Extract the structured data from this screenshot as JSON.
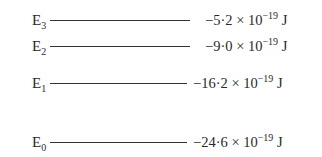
{
  "levels": [
    {
      "id": "E3",
      "letter": "E",
      "sub": "3",
      "mantissa": "−5·2 × 10",
      "exp": "−19",
      "unit": " J",
      "y": 20,
      "line_end": 190,
      "val_x": 205
    },
    {
      "id": "E2",
      "letter": "E",
      "sub": "2",
      "mantissa": "−9·0 × 10",
      "exp": "−19",
      "unit": " J",
      "y": 46,
      "line_end": 190,
      "val_x": 205
    },
    {
      "id": "E1",
      "letter": "E",
      "sub": "1",
      "mantissa": "−16·2 × 10",
      "exp": "−19",
      "unit": " J",
      "y": 83,
      "line_end": 187,
      "val_x": 193
    },
    {
      "id": "E0",
      "letter": "E",
      "sub": "0",
      "mantissa": "−24·6 × 10",
      "exp": "−19",
      "unit": " J",
      "y": 142,
      "line_end": 187,
      "val_x": 193
    }
  ]
}
